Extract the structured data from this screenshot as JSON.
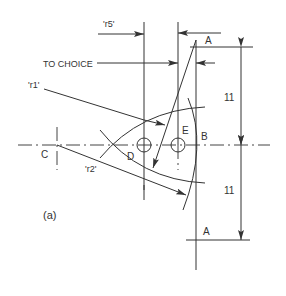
{
  "diagram": {
    "caption": "(a)",
    "labels": {
      "r5": "'r5'",
      "r1": "'r1'",
      "r2": "'r2'",
      "to_choice": "TO CHOICE",
      "point_a_top": "A",
      "point_a_bottom": "A",
      "point_b": "B",
      "point_c": "C",
      "point_d": "D",
      "point_e": "E"
    },
    "dimensions": {
      "upper": "11",
      "lower": "11"
    },
    "colors": {
      "line": "#333333",
      "background": "#ffffff"
    }
  }
}
